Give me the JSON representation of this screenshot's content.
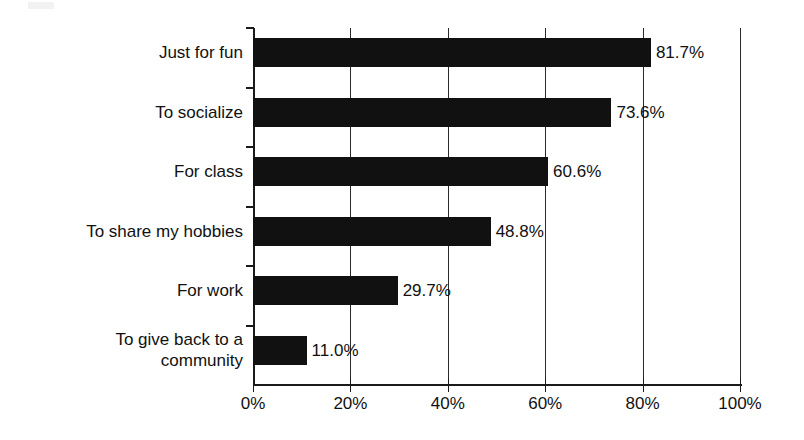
{
  "chart_data": {
    "type": "bar",
    "orientation": "horizontal",
    "title": "",
    "subtitle": "",
    "xlabel": "",
    "ylabel": "",
    "xlim": [
      0,
      100
    ],
    "grid": true,
    "legend": null,
    "legend_position": "none",
    "bar_color": "#111111",
    "axis_color": "#1a1a1a",
    "categories": [
      "Just for fun",
      "To socialize",
      "For class",
      "To share my hobbies",
      "For work",
      "To give back to a community"
    ],
    "values": [
      81.7,
      73.6,
      60.6,
      48.8,
      29.7,
      11.0
    ],
    "data_labels": [
      "81.7%",
      "73.6%",
      "60.6%",
      "48.8%",
      "29.7%",
      "11.0%"
    ],
    "xticks": [
      0,
      20,
      40,
      60,
      80,
      100
    ],
    "xtick_labels": [
      "0%",
      "20%",
      "40%",
      "60%",
      "80%",
      "100%"
    ]
  },
  "category_label_lines": [
    [
      "Just for fun"
    ],
    [
      "To socialize"
    ],
    [
      "For class"
    ],
    [
      "To share my hobbies"
    ],
    [
      "For work"
    ],
    [
      "To give back to a",
      "community"
    ]
  ]
}
